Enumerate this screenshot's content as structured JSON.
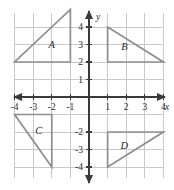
{
  "chart_data": {
    "type": "scatter",
    "title": "",
    "xlabel": "x",
    "ylabel": "y",
    "xlim": [
      -4.8,
      4.8
    ],
    "ylim": [
      -4.8,
      5.2
    ],
    "grid": true,
    "legend": "none",
    "x_tick_labels": [
      "-4",
      "-3",
      "-2",
      "-1",
      "1",
      "2",
      "3",
      "4"
    ],
    "x_tick_values": [
      -4,
      -3,
      -2,
      -1,
      1,
      2,
      3,
      4
    ],
    "y_tick_labels": [
      "4",
      "3",
      "2",
      "1",
      "-2",
      "-3",
      "-4"
    ],
    "y_tick_values": [
      4,
      3,
      2,
      1,
      -2,
      -3,
      -4
    ],
    "shapes": [
      {
        "label": "A",
        "type": "triangle",
        "vertices": [
          [
            -4,
            2
          ],
          [
            -1,
            2
          ],
          [
            -1,
            5
          ]
        ],
        "label_at": [
          -2.0,
          3.0
        ],
        "quadrant": "II"
      },
      {
        "label": "B",
        "type": "triangle",
        "vertices": [
          [
            1,
            4
          ],
          [
            1,
            2
          ],
          [
            4,
            2
          ]
        ],
        "label_at": [
          1.9,
          2.9
        ],
        "quadrant": "I"
      },
      {
        "label": "C",
        "type": "triangle",
        "vertices": [
          [
            -4,
            -1
          ],
          [
            -2,
            -1
          ],
          [
            -2,
            -4
          ]
        ],
        "label_at": [
          -2.7,
          -1.9
        ],
        "quadrant": "III"
      },
      {
        "label": "D",
        "type": "triangle",
        "vertices": [
          [
            1,
            -2
          ],
          [
            4,
            -2
          ],
          [
            1,
            -4
          ]
        ],
        "label_at": [
          1.9,
          -2.75
        ],
        "quadrant": "IV"
      }
    ]
  },
  "colors": {
    "background": "#ffffff",
    "gridline": "#c9c9c9",
    "axis": "#3a3a3a",
    "shape_stroke": "#8e8e8e",
    "text": "#2b2b2b"
  }
}
